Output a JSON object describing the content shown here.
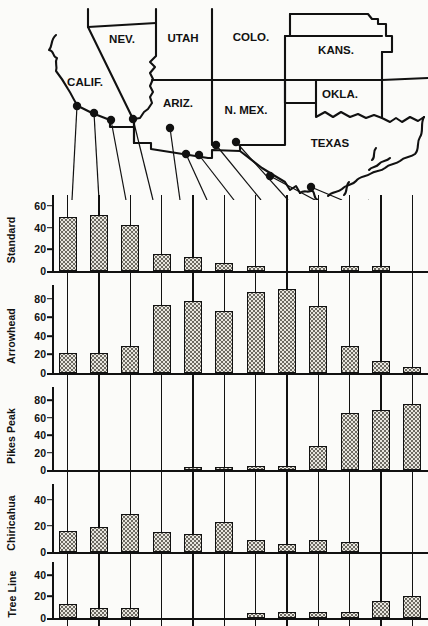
{
  "figure": {
    "type": "grouped-bar-with-map"
  },
  "map": {
    "state_labels": [
      {
        "name": "NEV.",
        "x": 122,
        "y": 43
      },
      {
        "name": "UTAH",
        "x": 183,
        "y": 42
      },
      {
        "name": "COLO.",
        "x": 251,
        "y": 41
      },
      {
        "name": "KANS.",
        "x": 336,
        "y": 54
      },
      {
        "name": "CALIF.",
        "x": 85,
        "y": 86
      },
      {
        "name": "ARIZ.",
        "x": 178,
        "y": 107
      },
      {
        "name": "N. MEX.",
        "x": 246,
        "y": 114
      },
      {
        "name": "OKLA.",
        "x": 340,
        "y": 98
      },
      {
        "name": "TEXAS",
        "x": 330,
        "y": 147
      }
    ],
    "site_markers": [
      {
        "id": 1,
        "x": 77,
        "y": 106
      },
      {
        "id": 2,
        "x": 94,
        "y": 113
      },
      {
        "id": 3,
        "x": 111,
        "y": 120
      },
      {
        "id": 4,
        "x": 133,
        "y": 119
      },
      {
        "id": 5,
        "x": 170,
        "y": 128
      },
      {
        "id": 6,
        "x": 186,
        "y": 154
      },
      {
        "id": 7,
        "x": 199,
        "y": 155
      },
      {
        "id": 8,
        "x": 216,
        "y": 145
      },
      {
        "id": 9,
        "x": 236,
        "y": 142
      },
      {
        "id": 10,
        "x": 270,
        "y": 176
      },
      {
        "id": 11,
        "x": 311,
        "y": 187
      },
      {
        "id": 12,
        "x": 348,
        "y": 213
      }
    ]
  },
  "chart_data": {
    "type": "bar",
    "title": "",
    "xlabel": "",
    "ylabel": "",
    "grid": false,
    "legend": "none",
    "categories": [
      "1",
      "2",
      "3",
      "4",
      "5",
      "6",
      "7",
      "8",
      "9",
      "10",
      "11",
      "12"
    ],
    "panels": [
      {
        "name": "Standard",
        "ylim": [
          0,
          70
        ],
        "ticks": [
          0,
          20,
          40,
          60
        ],
        "values": [
          50,
          52,
          42,
          16,
          13,
          7,
          5,
          0,
          5,
          5,
          5,
          0
        ]
      },
      {
        "name": "Arrowhead",
        "ylim": [
          0,
          95
        ],
        "ticks": [
          0,
          20,
          40,
          60,
          80
        ],
        "values": [
          22,
          22,
          29,
          73,
          78,
          67,
          87,
          91,
          72,
          29,
          13,
          7
        ]
      },
      {
        "name": "Pikes Peak",
        "ylim": [
          0,
          95
        ],
        "ticks": [
          0,
          20,
          40,
          60,
          80
        ],
        "values": [
          0,
          0,
          0,
          0,
          4,
          4,
          5,
          5,
          28,
          65,
          69,
          76
        ]
      },
      {
        "name": "Chiricahua",
        "ylim": [
          0,
          52
        ],
        "ticks": [
          0,
          20,
          40
        ],
        "values": [
          16,
          19,
          29,
          15,
          14,
          23,
          9,
          6,
          9,
          8,
          0,
          0
        ]
      },
      {
        "name": "Tree Line",
        "ylim": [
          0,
          52
        ],
        "ticks": [
          0,
          20,
          40
        ],
        "values": [
          13,
          9,
          9,
          0,
          0,
          0,
          5,
          6,
          6,
          6,
          16,
          20
        ]
      }
    ]
  },
  "colors": {
    "ink": "#111111",
    "paper": "#fbfbf9",
    "bar_fill": "#e8e6df",
    "bar_stipple": "#6d6a62"
  }
}
